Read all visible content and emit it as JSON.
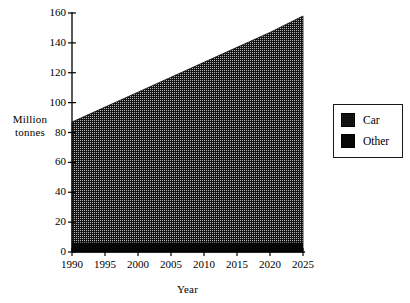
{
  "chart_data": {
    "type": "area",
    "title": "",
    "xlabel": "Year",
    "ylabel": "Million tonnes",
    "stacked": true,
    "grid": false,
    "legend_position": "right",
    "x": [
      1990,
      1995,
      2000,
      2005,
      2010,
      2015,
      2020,
      2025
    ],
    "xtick_labels": [
      "1990",
      "1995",
      "2000",
      "2005",
      "2010",
      "2015",
      "2020",
      "2025"
    ],
    "xlim": [
      1990,
      2025
    ],
    "ytick_labels": [
      "0",
      "20",
      "40",
      "60",
      "80",
      "100",
      "120",
      "140",
      "160"
    ],
    "yticks": [
      0,
      20,
      40,
      60,
      80,
      100,
      120,
      140,
      160
    ],
    "ylim": [
      0,
      160
    ],
    "series": [
      {
        "name": "Car",
        "pattern": "dotted-hatch",
        "color": "#111111",
        "values": [
          81,
          91,
          101,
          111,
          121,
          131,
          141,
          152
        ]
      },
      {
        "name": "Other",
        "pattern": "solid",
        "color": "#050505",
        "values": [
          6,
          6,
          6,
          6,
          6,
          6,
          6,
          6
        ]
      }
    ],
    "totals": [
      87,
      97,
      107,
      117,
      127,
      137,
      147,
      158
    ]
  },
  "axes": {
    "y_title_line1": "Million",
    "y_title_line2": "tonnes",
    "x_title": "Year"
  },
  "legend": {
    "items": [
      {
        "label": "Car"
      },
      {
        "label": "Other"
      }
    ]
  }
}
